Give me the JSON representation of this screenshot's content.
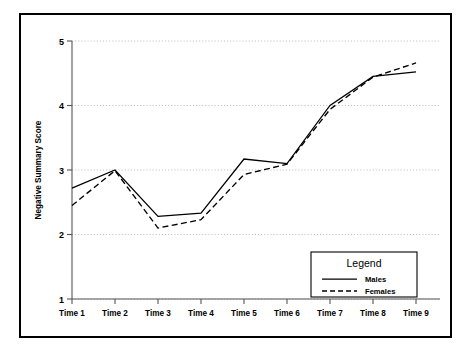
{
  "chart_data": {
    "type": "line",
    "title": "",
    "subtitle": "",
    "xlabel": "",
    "ylabel": "Negative Summary Score",
    "categories": [
      "Time 1",
      "Time 2",
      "Time 3",
      "Time 4",
      "Time 5",
      "Time 6",
      "Time 7",
      "Time 8",
      "Time 9"
    ],
    "series": [
      {
        "name": "Males",
        "style": "solid",
        "color": "#000000",
        "values": [
          2.72,
          3.0,
          2.28,
          2.33,
          3.17,
          3.1,
          4.0,
          4.45,
          4.52
        ]
      },
      {
        "name": "Females",
        "style": "dashed",
        "color": "#000000",
        "values": [
          2.45,
          2.99,
          2.1,
          2.23,
          2.93,
          3.09,
          3.94,
          4.44,
          4.66
        ]
      }
    ],
    "ylim": [
      1,
      5
    ],
    "yticks": [
      1,
      2,
      3,
      4,
      5
    ],
    "ytick_labels": [
      "1",
      "2",
      "3",
      "4",
      "5"
    ],
    "xlim": [
      0,
      8
    ],
    "grid": true,
    "grid_axis": "y",
    "legend_position": "lower right"
  },
  "legend": {
    "title": "Legend",
    "entries": [
      {
        "label": "Males",
        "style": "solid"
      },
      {
        "label": "Females",
        "style": "dashed"
      }
    ]
  },
  "colors": {
    "frame": "#000000",
    "axis": "#555555",
    "grid": "#b9b9b9",
    "background": "#ffffff",
    "series": "#000000"
  }
}
